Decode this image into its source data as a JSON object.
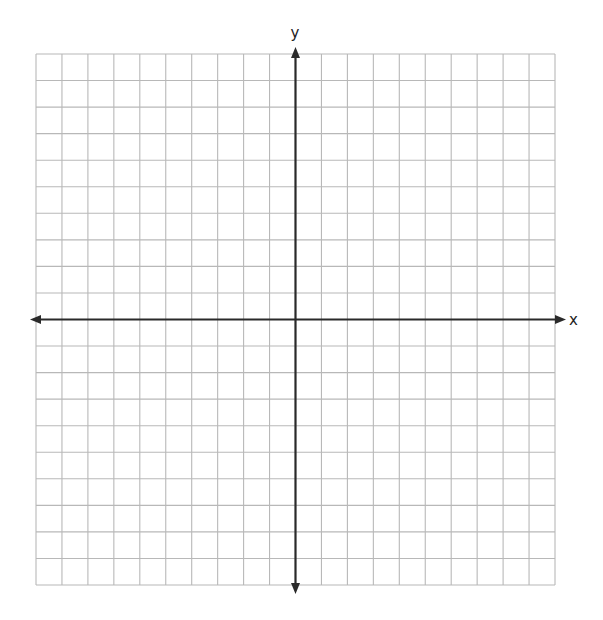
{
  "chart_data": {
    "type": "scatter",
    "title": "",
    "xlabel": "x",
    "ylabel": "y",
    "xlim": [
      -10,
      10
    ],
    "ylim": [
      -10,
      10
    ],
    "grid": true,
    "grid_step": 1,
    "tick_labels": false,
    "series": [],
    "axis_arrows": true,
    "colors": {
      "grid": "#b8b8b8",
      "axis": "#2a2a2a",
      "background": "#ffffff"
    }
  }
}
